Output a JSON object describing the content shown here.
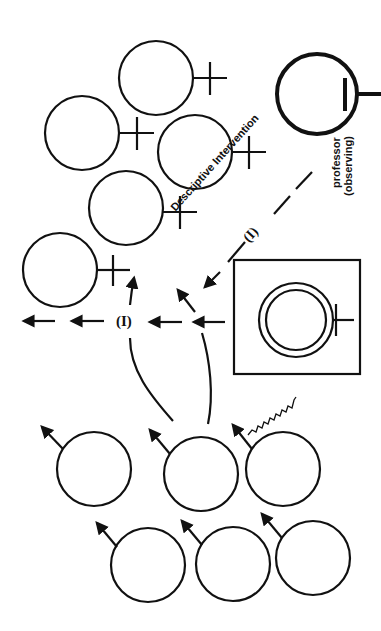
{
  "labels": {
    "intervention_text": "Descriptive Intervention",
    "intervention_marker": "(I)",
    "arrow_marker": "(I)",
    "professor_line1": "professor",
    "professor_line2": "(observing)"
  },
  "colors": {
    "ink": "#111111",
    "background": "#ffffff"
  },
  "figures": {
    "females": [
      {
        "cx": 156,
        "cy": 78,
        "r": 37
      },
      {
        "cx": 82,
        "cy": 133,
        "r": 37
      },
      {
        "cx": 195,
        "cy": 152,
        "r": 37
      },
      {
        "cx": 126,
        "cy": 208,
        "r": 37
      },
      {
        "cx": 60,
        "cy": 270,
        "r": 37
      }
    ],
    "professor": {
      "cx": 317,
      "cy": 94,
      "r": 40
    },
    "boxed_female": {
      "x": 234,
      "y": 260,
      "w": 126,
      "h": 114,
      "cx": 296,
      "cy": 320,
      "r_outer": 37,
      "r_inner": 30
    },
    "males": [
      {
        "cx": 94,
        "cy": 469,
        "r": 37
      },
      {
        "cx": 201,
        "cy": 474,
        "r": 37
      },
      {
        "cx": 283,
        "cy": 469,
        "r": 37
      },
      {
        "cx": 148,
        "cy": 565,
        "r": 37
      },
      {
        "cx": 233,
        "cy": 564,
        "r": 37
      },
      {
        "cx": 313,
        "cy": 558,
        "r": 37
      }
    ]
  }
}
